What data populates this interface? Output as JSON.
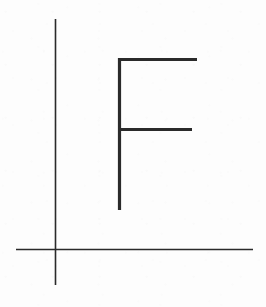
{
  "figure": {
    "background_color": "#fdfdfd",
    "stroke_color": "#2a2a2a",
    "width": 266,
    "height": 307,
    "axes": {
      "label": "coordinate-axes",
      "stroke_width": 1.6,
      "vertical": {
        "label": "vertical-axis",
        "x1": 55.5,
        "y1": 19,
        "x2": 55.5,
        "y2": 285
      },
      "horizontal": {
        "label": "horizontal-axis",
        "x1": 16,
        "y1": 249.5,
        "x2": 253,
        "y2": 249.5
      },
      "origin": {
        "x": 55.5,
        "y": 249.5
      }
    },
    "glyph": {
      "label": "letter-f",
      "character": "F",
      "stroke_width": 3.2,
      "strokes": [
        {
          "name": "f-stem",
          "x1": 119.5,
          "y1": 58,
          "x2": 119.5,
          "y2": 210
        },
        {
          "name": "f-top-bar",
          "x1": 118,
          "y1": 59.5,
          "x2": 197,
          "y2": 59.5
        },
        {
          "name": "f-middle-bar",
          "x1": 118,
          "y1": 129.5,
          "x2": 192,
          "y2": 129.5
        }
      ]
    }
  }
}
